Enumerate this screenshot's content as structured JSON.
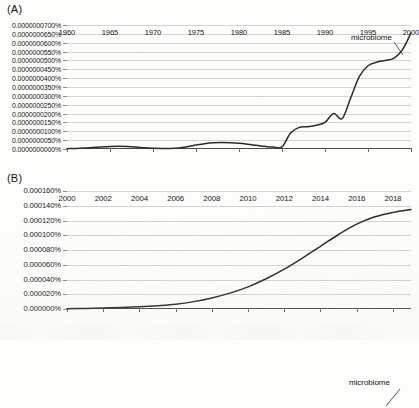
{
  "figure": {
    "panel_a_label": "(A)",
    "panel_b_label": "(B)",
    "series_name": "microbiome"
  },
  "chart_data": [
    {
      "type": "line",
      "title": "(A)",
      "xlabel": "",
      "ylabel": "",
      "grid": true,
      "legend_position": "inline-right",
      "series_label": "microbiome",
      "xlim": [
        1960,
        2000
      ],
      "ylim": [
        0,
        7e-08
      ],
      "xticks": [
        1960,
        1965,
        1970,
        1975,
        1980,
        1985,
        1990,
        1995,
        2000
      ],
      "xtick_labels": [
        "1960",
        "1965",
        "1970",
        "1975",
        "1980",
        "1985",
        "1990",
        "1995",
        "2000"
      ],
      "yticks": [
        7e-08,
        6.5e-08,
        6e-08,
        5.5e-08,
        5e-08,
        4.5e-08,
        4e-08,
        3.5e-08,
        3e-08,
        2.5e-08,
        2e-08,
        1.5e-08,
        1e-08,
        5e-09,
        0
      ],
      "ytick_labels": [
        "0.0000000700%",
        "0.0000000650%",
        "0.0000000600%",
        "0.0000000550%",
        "0.0000000500%",
        "0.0000000450%",
        "0.0000000400%",
        "0.0000000350%",
        "0.0000000300%",
        "0.0000000250%",
        "0.0000000200%",
        "0.0000000150%",
        "0.0000000100%",
        "0.0000000050%",
        "0.0000000000%"
      ],
      "series": [
        {
          "name": "microbiome",
          "x": [
            1960,
            1961,
            1962,
            1963,
            1964,
            1965,
            1966,
            1967,
            1968,
            1969,
            1970,
            1971,
            1972,
            1973,
            1974,
            1975,
            1976,
            1977,
            1978,
            1979,
            1980,
            1981,
            1982,
            1983,
            1984,
            1985,
            1986,
            1987,
            1988,
            1989,
            1990,
            1991,
            1992,
            1993,
            1994,
            1995,
            1996,
            1997,
            1998,
            1999,
            2000
          ],
          "values": [
            2e-10,
            3e-10,
            5e-10,
            8e-10,
            1.1e-09,
            1.4e-09,
            1.5e-09,
            1.4e-09,
            1.1e-09,
            7e-10,
            4e-10,
            3e-10,
            3e-10,
            6e-10,
            1.3e-09,
            2.2e-09,
            3e-09,
            3.5e-09,
            3.6e-09,
            3.5e-09,
            3.2e-09,
            2.7e-09,
            2.1e-09,
            1.5e-09,
            1.1e-09,
            1.2e-09,
            9e-09,
            1.22e-08,
            1.26e-08,
            1.34e-08,
            1.5e-08,
            2e-08,
            1.72e-08,
            2.9e-08,
            4.1e-08,
            4.7e-08,
            4.9e-08,
            5e-08,
            5.12e-08,
            5.6e-08,
            6.55e-08
          ]
        }
      ]
    },
    {
      "type": "line",
      "title": "(B)",
      "xlabel": "",
      "ylabel": "",
      "grid": true,
      "legend_position": "inline-right",
      "series_label": "microbiome",
      "xlim": [
        2000,
        2019
      ],
      "ylim": [
        0,
        0.00016
      ],
      "xticks": [
        2000,
        2002,
        2004,
        2006,
        2008,
        2010,
        2012,
        2014,
        2016,
        2018
      ],
      "xtick_labels": [
        "2000",
        "2002",
        "2004",
        "2006",
        "2008",
        "2010",
        "2012",
        "2014",
        "2016",
        "2018"
      ],
      "yticks": [
        0.00016,
        0.00014,
        0.00012,
        0.0001,
        8e-05,
        6e-05,
        4e-05,
        2e-05,
        0
      ],
      "ytick_labels": [
        "0.000160%",
        "0.000140%",
        "0.000120%",
        "0.000100%",
        "0.000080%",
        "0.000060%",
        "0.000040%",
        "0.000020%",
        "0.000000%"
      ],
      "series": [
        {
          "name": "microbiome",
          "x": [
            2000,
            2001,
            2002,
            2003,
            2004,
            2005,
            2006,
            2007,
            2008,
            2009,
            2010,
            2011,
            2012,
            2013,
            2014,
            2015,
            2016,
            2017,
            2018,
            2019
          ],
          "values": [
            5e-07,
            8e-07,
            1.3e-06,
            2e-06,
            3e-06,
            4.5e-06,
            6.5e-06,
            1e-05,
            1.5e-05,
            2.15e-05,
            3e-05,
            4.1e-05,
            5.4e-05,
            6.9e-05,
            8.5e-05,
            0.000101,
            0.000115,
            0.000125,
            0.000131,
            0.000135
          ]
        }
      ]
    }
  ]
}
